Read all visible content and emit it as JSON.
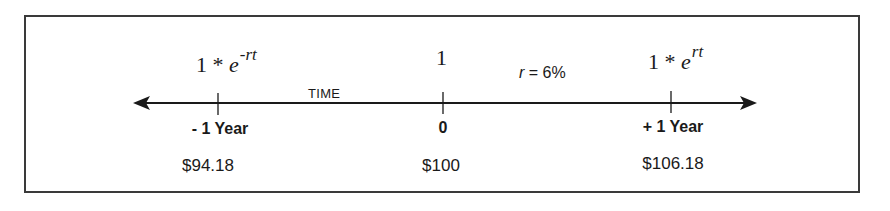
{
  "diagram": {
    "type": "timeline",
    "axis_title": "TIME",
    "rate": {
      "symbol": "r",
      "equals": " = ",
      "value": "6%"
    },
    "points": [
      {
        "id": "past",
        "formula_base": "1 * ",
        "formula_e": "e",
        "formula_exponent": "-rt",
        "period": "- 1 Year",
        "value": "$94.18"
      },
      {
        "id": "present",
        "formula_base": "1",
        "formula_e": "",
        "formula_exponent": "",
        "period": "0",
        "value": "$100"
      },
      {
        "id": "future",
        "formula_base": "1 * ",
        "formula_e": "e",
        "formula_exponent": "rt",
        "period": "+ 1 Year",
        "value": "$106.18"
      }
    ],
    "colors": {
      "line": "#1a1a1a",
      "frame": "#3a3a3a",
      "text": "#1a1a1a",
      "background": "#ffffff"
    }
  }
}
